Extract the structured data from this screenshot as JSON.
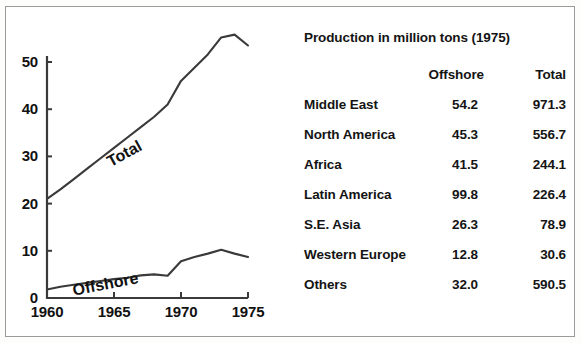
{
  "chart_data": {
    "type": "line",
    "title": "",
    "xlabel": "",
    "ylabel": "",
    "xlim": [
      1960,
      1975
    ],
    "ylim": [
      0,
      50
    ],
    "grid": false,
    "legend": "inline-labels",
    "xticks": [
      "1960",
      "1965",
      "1970",
      "1975"
    ],
    "yticks": [
      "0",
      "10",
      "20",
      "30",
      "40",
      "50"
    ],
    "x": [
      1960,
      1961,
      1962,
      1963,
      1964,
      1965,
      1966,
      1967,
      1968,
      1969,
      1970,
      1971,
      1972,
      1973,
      1974,
      1975
    ],
    "series": [
      {
        "name": "Total",
        "values": [
          21.0,
          23.0,
          25.2,
          27.4,
          29.6,
          31.8,
          34.0,
          36.2,
          38.4,
          41.0,
          46.0,
          48.8,
          51.6,
          55.2,
          55.8,
          53.5
        ]
      },
      {
        "name": "Offshore",
        "values": [
          1.8,
          2.4,
          2.8,
          3.2,
          3.6,
          4.0,
          4.3,
          4.8,
          5.0,
          4.7,
          7.8,
          8.7,
          9.4,
          10.2,
          9.4,
          8.7
        ]
      }
    ]
  },
  "chart": {
    "series_labels": {
      "total": "Total",
      "offshore": "Offshore"
    }
  },
  "table": {
    "title": "Production in million tons (1975)",
    "headers": {
      "region": "",
      "offshore": "Offshore",
      "total": "Total"
    },
    "rows": [
      {
        "region": "Middle East",
        "offshore": "54.2",
        "total": "971.3"
      },
      {
        "region": "North America",
        "offshore": "45.3",
        "total": "556.7"
      },
      {
        "region": "Africa",
        "offshore": "41.5",
        "total": "244.1"
      },
      {
        "region": "Latin America",
        "offshore": "99.8",
        "total": "226.4"
      },
      {
        "region": "S.E. Asia",
        "offshore": "26.3",
        "total": "78.9"
      },
      {
        "region": "Western Europe",
        "offshore": "12.8",
        "total": "30.6"
      },
      {
        "region": "Others",
        "offshore": "32.0",
        "total": "590.5"
      }
    ]
  },
  "colors": {
    "ink": "#141414",
    "line": "#3a3a3a",
    "frame": "#9a9a9a",
    "background": "#ffffff"
  }
}
